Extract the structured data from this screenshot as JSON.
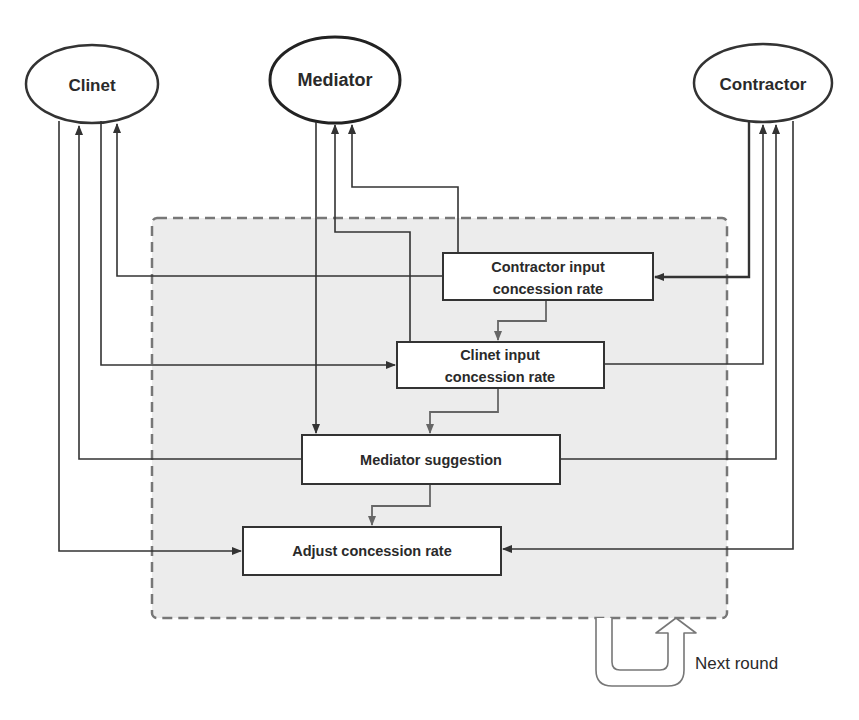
{
  "diagram": {
    "colors": {
      "background": "#ffffff",
      "line": "#333333",
      "flow_line": "#555555",
      "round_box_fill": "#ececec",
      "round_box_border": "#777777",
      "box_fill": "#ffffff"
    },
    "actors": {
      "client": "Clinet",
      "mediator": "Mediator",
      "contractor": "Contractor"
    },
    "steps": {
      "contractor_input": [
        "Contractor input",
        "concession rate"
      ],
      "client_input": [
        "Clinet input",
        "concession rate"
      ],
      "mediator_suggestion": "Mediator suggestion",
      "adjust": "Adjust concession rate"
    },
    "loop_label": "Next round"
  }
}
